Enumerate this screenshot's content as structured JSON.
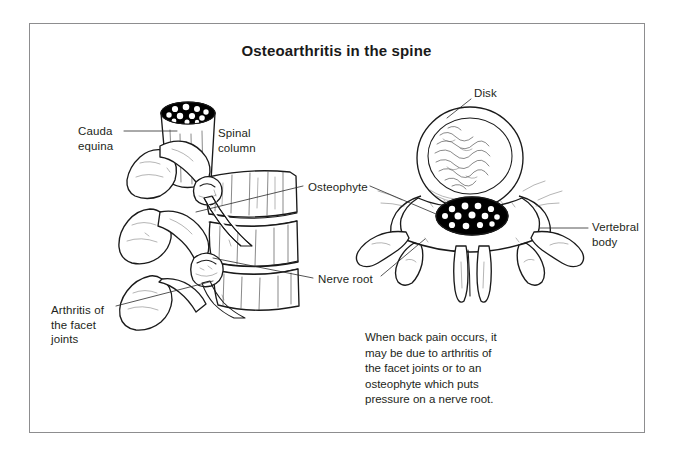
{
  "document": {
    "title": "Osteoarthritis in the spine",
    "type": "medical-illustration",
    "background_color": "#ffffff",
    "ink_color": "#231f20",
    "frame_color": "#8d8d8f"
  },
  "labels": {
    "cauda_equina": "Cauda\nequina",
    "spinal_column": "Spinal\ncolumn",
    "osteophyte": "Osteophyte",
    "nerve_root": "Nerve root",
    "arthritis_facet_joints": "Arthritis of\nthe facet\njoints",
    "disk": "Disk",
    "vertebral_body": "Vertebral\nbody"
  },
  "caption": {
    "note": "When back pain occurs, it\nmay be due to arthritis of\nthe facet joints or to an\nosteophyte which puts\npressure on a nerve root."
  },
  "figures": {
    "left": {
      "name": "lateral-lumbar-spine",
      "description": "Side view of lumbar vertebrae with cauda equina, facet joints, nerve roots and osteophyte"
    },
    "right": {
      "name": "axial-vertebra-cross-section",
      "description": "Cross-section showing disk, spinal canal with nerve roots, vertebral body and processes"
    }
  }
}
